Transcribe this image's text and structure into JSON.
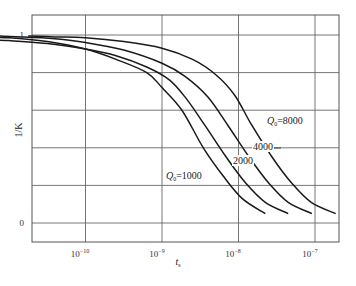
{
  "chart_data": {
    "type": "line",
    "title": "",
    "xlabel": "t_s",
    "ylabel": "1/K",
    "xscale": "log",
    "xlim": [
      3.2e-12,
      2.5e-07
    ],
    "ylim": [
      -0.1,
      1.1
    ],
    "x_ticks": [
      {
        "value": 1e-10,
        "label": "10⁻¹⁰"
      },
      {
        "value": 1e-09,
        "label": "10⁻⁹"
      },
      {
        "value": 1e-08,
        "label": "10⁻⁸"
      },
      {
        "value": 1e-07,
        "label": "10⁻⁷"
      }
    ],
    "y_ticks": [
      {
        "value": 1,
        "label": "1"
      },
      {
        "value": 0.8,
        "label": ""
      },
      {
        "value": 0.6,
        "label": ""
      },
      {
        "value": 0.4,
        "label": ""
      },
      {
        "value": 0.2,
        "label": ""
      },
      {
        "value": 0,
        "label": "0"
      }
    ],
    "grid": true,
    "legend": "inline curve labels",
    "series": [
      {
        "name": "Q0=1000",
        "label": "Q0=1000",
        "log10_x": [
          -11.73,
          -11.0,
          -10.5,
          -10.0,
          -9.6,
          -9.2,
          -9.0,
          -8.74,
          -8.46,
          -8.2,
          -7.95,
          -7.65
        ],
        "y": [
          0.995,
          0.985,
          0.965,
          0.925,
          0.87,
          0.8,
          0.72,
          0.6,
          0.4,
          0.25,
          0.13,
          0.05
        ]
      },
      {
        "name": "Q0=2000",
        "label": "2000",
        "log10_x": [
          -11.42,
          -11.0,
          -10.5,
          -10.0,
          -9.6,
          -9.2,
          -8.9,
          -8.68,
          -8.44,
          -8.16,
          -7.9,
          -7.65,
          -7.35
        ],
        "y": [
          0.975,
          0.97,
          0.955,
          0.925,
          0.89,
          0.83,
          0.76,
          0.66,
          0.52,
          0.35,
          0.21,
          0.11,
          0.05
        ]
      },
      {
        "name": "Q0=4000",
        "label": "4000",
        "log10_x": [
          -11.17,
          -10.8,
          -10.4,
          -10.0,
          -9.5,
          -9.0,
          -8.7,
          -8.4,
          -8.14,
          -7.86,
          -7.6,
          -7.35,
          -7.04
        ],
        "y": [
          0.995,
          0.99,
          0.98,
          0.96,
          0.92,
          0.85,
          0.78,
          0.67,
          0.52,
          0.35,
          0.21,
          0.11,
          0.05
        ]
      },
      {
        "name": "Q0=8000",
        "label": "Q0=8000",
        "log10_x": [
          -10.75,
          -10.4,
          -10.0,
          -9.5,
          -9.0,
          -8.6,
          -8.3,
          -8.05,
          -7.84,
          -7.56,
          -7.3,
          -7.05,
          -6.73
        ],
        "y": [
          0.995,
          0.99,
          0.985,
          0.965,
          0.93,
          0.87,
          0.79,
          0.68,
          0.53,
          0.35,
          0.21,
          0.11,
          0.05
        ]
      }
    ]
  },
  "axes": {
    "xlabel": "t",
    "xlabel_sub": "s",
    "ylabel": "1/K",
    "ytick_1": "1",
    "ytick_0": "0",
    "xticks": [
      "10",
      "10",
      "10",
      "10"
    ],
    "xtick_exps": [
      "−10",
      "−9",
      "−8",
      "−7"
    ]
  },
  "annotations": {
    "q1000_prefix": "Q",
    "q1000_sub": "0",
    "q1000_value": "=1000",
    "q2000": "2000",
    "q4000": "4000",
    "q8000_prefix": "Q",
    "q8000_sub": "0",
    "q8000_value": "=8000"
  }
}
